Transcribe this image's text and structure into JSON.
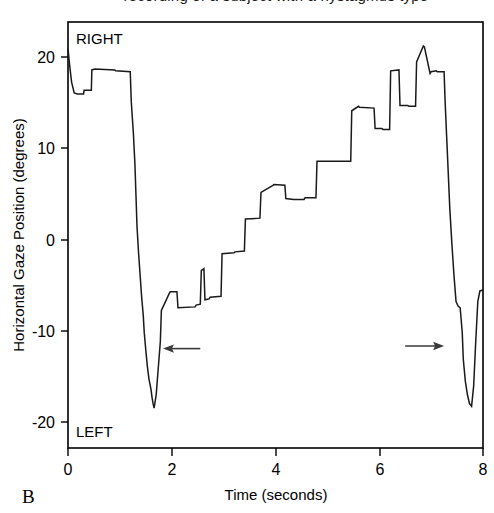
{
  "figure": {
    "panel_letter": "B",
    "clipped_top_caption": "recording of a subject with a nystagmus type"
  },
  "chart_data": {
    "type": "line",
    "title": "",
    "xlabel": "Time (seconds)",
    "ylabel": "Horizontal Gaze Position (degrees)",
    "xlim": [
      0,
      8
    ],
    "ylim": [
      -24,
      24
    ],
    "xticks": [
      0,
      2,
      4,
      6,
      8
    ],
    "xticklabels": [
      "0",
      "2",
      "4",
      "6",
      "8"
    ],
    "yticks": [
      20,
      10,
      0,
      -10,
      -20
    ],
    "yticklabels": [
      "20",
      "10",
      "0",
      "-10",
      "-20"
    ],
    "grid": false,
    "legend": null,
    "direction_labels": {
      "top": "RIGHT",
      "bottom": "LEFT"
    },
    "annotations": [
      {
        "name": "leftward-arrow",
        "glyph": "left-arrow",
        "x_start": 2.55,
        "x_end": 1.83,
        "y": -12.8
      },
      {
        "name": "rightward-arrow",
        "glyph": "right-arrow",
        "x_start": 6.5,
        "x_end": 7.25,
        "y": -12.5
      }
    ],
    "series": [
      {
        "name": "Horizontal gaze position",
        "color": "#1a1a1a",
        "x": [
          0.0,
          0.03,
          0.07,
          0.12,
          0.18,
          0.3,
          0.31,
          0.33,
          0.45,
          0.46,
          0.52,
          0.9,
          0.92,
          1.2,
          1.22,
          1.26,
          1.29,
          1.31,
          1.33,
          1.36,
          1.39,
          1.42,
          1.45,
          1.47,
          1.5,
          1.53,
          1.56,
          1.6,
          1.62,
          1.64,
          1.66,
          1.7,
          1.78,
          1.8,
          1.95,
          1.97,
          2.1,
          2.12,
          2.45,
          2.47,
          2.55,
          2.57,
          2.62,
          2.64,
          2.72,
          2.74,
          2.95,
          2.97,
          3.2,
          3.22,
          3.4,
          3.42,
          3.7,
          3.72,
          3.95,
          3.97,
          4.18,
          4.2,
          4.35,
          4.37,
          4.55,
          4.57,
          4.78,
          4.8,
          5.45,
          5.47,
          5.6,
          5.62,
          5.9,
          5.92,
          6.05,
          6.07,
          6.2,
          6.22,
          6.38,
          6.4,
          6.55,
          6.57,
          6.7,
          6.72,
          6.85,
          6.87,
          6.98,
          7.0,
          7.1,
          7.12,
          7.25,
          7.27,
          7.3,
          7.33,
          7.36,
          7.4,
          7.44,
          7.48,
          7.52,
          7.56,
          7.6,
          7.62,
          7.66,
          7.7,
          7.74,
          7.78,
          7.82,
          7.86,
          7.9,
          7.94,
          8.0
        ],
        "y": [
          21.0,
          19.2,
          17.2,
          16.0,
          15.9,
          15.9,
          16.3,
          16.3,
          16.3,
          18.6,
          18.7,
          18.6,
          18.5,
          18.4,
          15.0,
          11.5,
          8.0,
          4.5,
          1.0,
          -2.0,
          -4.5,
          -7.0,
          -9.0,
          -11.0,
          -13.0,
          -14.8,
          -16.2,
          -17.4,
          -18.3,
          -19.0,
          -19.5,
          -18.0,
          -12.0,
          -8.5,
          -6.6,
          -6.4,
          -6.4,
          -8.2,
          -8.1,
          -7.9,
          -7.8,
          -4.0,
          -3.8,
          -7.3,
          -7.2,
          -7.0,
          -6.9,
          -2.1,
          -2.0,
          -1.9,
          -1.8,
          1.8,
          1.9,
          4.8,
          5.6,
          5.7,
          5.6,
          4.1,
          4.0,
          4.0,
          4.0,
          4.2,
          4.2,
          8.3,
          8.3,
          14.0,
          14.5,
          14.4,
          14.3,
          12.0,
          12.0,
          11.9,
          11.9,
          18.5,
          18.6,
          14.6,
          14.6,
          14.5,
          14.5,
          19.5,
          21.3,
          21.2,
          18.2,
          18.4,
          18.5,
          18.4,
          18.4,
          15.0,
          11.0,
          7.0,
          3.0,
          -1.0,
          -4.5,
          -7.5,
          -8.0,
          -8.2,
          -11.0,
          -14.0,
          -16.5,
          -18.0,
          -19.0,
          -19.3,
          -17.0,
          -12.0,
          -7.5,
          -6.3,
          -6.2
        ]
      }
    ]
  }
}
